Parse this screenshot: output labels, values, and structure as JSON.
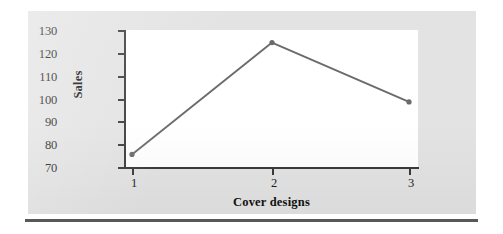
{
  "chart_data": {
    "type": "line",
    "title": "",
    "xlabel": "Cover designs",
    "ylabel": "Sales",
    "categories": [
      "1",
      "2",
      "3"
    ],
    "values": [
      75.5,
      124.5,
      98.5
    ],
    "series": [
      {
        "name": "Sales",
        "values": [
          75.5,
          124.5,
          98.5
        ]
      }
    ],
    "ylim": [
      70,
      130
    ],
    "yticks": [
      70,
      80,
      90,
      100,
      110,
      120,
      130
    ],
    "ytick_labels": [
      "70",
      "80",
      "90",
      "100",
      "110",
      "120",
      "130"
    ],
    "xticks": [
      1,
      2,
      3
    ],
    "xtick_labels": [
      "1",
      "2",
      "3"
    ],
    "grid": false,
    "legend": false,
    "marker": "circle",
    "colors": {
      "line": "#6b6b6b",
      "marker": "#6b6b6b",
      "axis": "#3a3a3a",
      "plot_background": "#ffffff",
      "figure_background": "#e3e3e3",
      "text": "#1d1d1d",
      "rule": "#585858"
    }
  }
}
